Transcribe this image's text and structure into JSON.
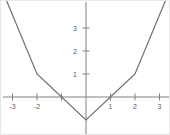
{
  "chart_data": {
    "type": "line",
    "title": "",
    "subtitle": "",
    "xlabel": "",
    "ylabel": "",
    "xlim": [
      -3.55,
      3.55
    ],
    "ylim": [
      -1.45,
      4.95
    ],
    "grid": false,
    "legend": null,
    "axes": {
      "x_ticks": [
        -3,
        -2,
        -1,
        1,
        2,
        3
      ],
      "x_tick_labels": [
        "-3",
        "-2",
        "",
        "1",
        "2",
        "3"
      ],
      "y_ticks": [
        1,
        2,
        3
      ],
      "y_tick_labels": [
        "1",
        "2",
        "3"
      ],
      "origin_label": "",
      "axis_color": "#808080",
      "tick_color": "#808080",
      "label_color": "#5a5a5a"
    },
    "series": [
      {
        "name": "piecewise-linear",
        "color": "#6e6e6e",
        "width": 1.2,
        "x": [
          -3.5,
          -2,
          0,
          2,
          3.5
        ],
        "y": [
          4.85,
          1,
          -1,
          1,
          4.85
        ],
        "vertices": [
          {
            "x": -3.5,
            "y": 4.85
          },
          {
            "x": -2,
            "y": 1
          },
          {
            "x": 0,
            "y": -1
          },
          {
            "x": 2,
            "y": 1
          },
          {
            "x": 3.5,
            "y": 4.85
          }
        ]
      }
    ],
    "annotations": []
  },
  "figure": {
    "background": "#ffffff",
    "border_color": "#e8e8e8"
  }
}
